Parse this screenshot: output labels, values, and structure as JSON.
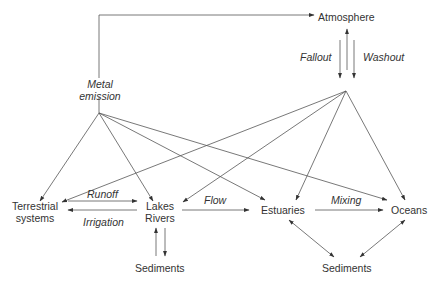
{
  "diagram": {
    "nodes": {
      "atmosphere": "Atmosphere",
      "metal_emission_line1": "Metal",
      "metal_emission_line2": "emission",
      "terrestrial_line1": "Terrestrial",
      "terrestrial_line2": "systems",
      "lakes_line1": "Lakes",
      "lakes_line2": "Rivers",
      "estuaries": "Estuaries",
      "oceans": "Oceans",
      "sediments_left": "Sediments",
      "sediments_right": "Sediments"
    },
    "edge_labels": {
      "fallout": "Fallout",
      "washout": "Washout",
      "runoff": "Runoff",
      "irrigation": "Irrigation",
      "flow": "Flow",
      "mixing": "Mixing"
    },
    "colors": {
      "line": "#444444",
      "text": "#333333",
      "background": "#ffffff"
    }
  }
}
